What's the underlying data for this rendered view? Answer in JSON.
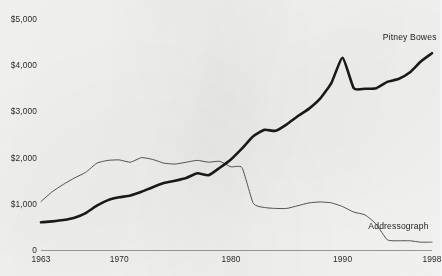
{
  "chart_data": {
    "type": "line",
    "title": "",
    "subtitle": "",
    "xlabel": "",
    "ylabel": "",
    "xlim": [
      1963,
      1998
    ],
    "ylim": [
      0,
      5000
    ],
    "grid": false,
    "legend_position": "inline-end-of-line",
    "y_tick_labels": [
      "$5,000",
      "$4,000",
      "$3,000",
      "$2,000",
      "$1,000",
      "0"
    ],
    "y_tick_values": [
      5000,
      4000,
      3000,
      2000,
      1000,
      0
    ],
    "x_tick_labels": [
      "1963",
      "1970",
      "1980",
      "1990",
      "1998"
    ],
    "x_tick_values": [
      1963,
      1970,
      1980,
      1990,
      1998
    ],
    "x": [
      1963,
      1964,
      1965,
      1966,
      1967,
      1968,
      1969,
      1970,
      1971,
      1972,
      1973,
      1974,
      1975,
      1976,
      1977,
      1978,
      1979,
      1980,
      1981,
      1982,
      1983,
      1984,
      1985,
      1986,
      1987,
      1988,
      1989,
      1990,
      1991,
      1992,
      1993,
      1994,
      1995,
      1996,
      1997,
      1998
    ],
    "series": [
      {
        "name": "Pitney Bowes",
        "color": "#1a1a1a",
        "line_width": 2.6,
        "label_x": 1996,
        "label_y": 4620,
        "values": [
          600,
          620,
          650,
          700,
          800,
          960,
          1080,
          1140,
          1180,
          1260,
          1360,
          1450,
          1500,
          1560,
          1660,
          1620,
          1780,
          1960,
          2200,
          2460,
          2600,
          2580,
          2720,
          2900,
          3060,
          3280,
          3620,
          4160,
          3500,
          3490,
          3500,
          3640,
          3700,
          3840,
          4080,
          4260
        ]
      },
      {
        "name": "Addressograph",
        "color": "#555555",
        "line_width": 1.0,
        "label_x": 1995,
        "label_y": 520,
        "values": [
          1050,
          1260,
          1420,
          1560,
          1680,
          1880,
          1940,
          1950,
          1900,
          2000,
          1960,
          1880,
          1860,
          1900,
          1940,
          1900,
          1920,
          1800,
          1780,
          1010,
          920,
          900,
          900,
          960,
          1020,
          1040,
          1020,
          940,
          820,
          760,
          560,
          220,
          200,
          200,
          170,
          170
        ]
      }
    ]
  }
}
